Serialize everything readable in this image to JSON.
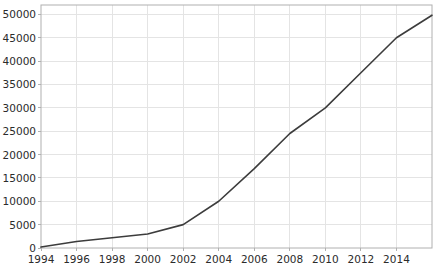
{
  "chart_data": {
    "type": "line",
    "title": "",
    "subtitle": "",
    "xlabel": "",
    "ylabel": "",
    "x": [
      1994,
      1996,
      1998,
      2000,
      2002,
      2004,
      2006,
      2008,
      2010,
      2012,
      2014,
      2016
    ],
    "values": [
      200,
      1400,
      2200,
      3000,
      5000,
      10000,
      17000,
      24500,
      30000,
      37500,
      45000,
      49800
    ],
    "series": [
      {
        "name": "series-1",
        "values": [
          200,
          1400,
          2200,
          3000,
          5000,
          10000,
          17000,
          24500,
          30000,
          37500,
          45000,
          49800
        ]
      }
    ],
    "xlim": [
      1994,
      2016
    ],
    "ylim": [
      0,
      52000
    ],
    "xticks": [
      1994,
      1996,
      1998,
      2000,
      2002,
      2004,
      2006,
      2008,
      2010,
      2012,
      2014
    ],
    "xtick_labels": [
      "1994",
      "1996",
      "1998",
      "2000",
      "2002",
      "2004",
      "2006",
      "2008",
      "2010",
      "2012",
      "2014"
    ],
    "yticks": [
      0,
      5000,
      10000,
      15000,
      20000,
      25000,
      30000,
      35000,
      40000,
      45000,
      50000
    ],
    "ytick_labels": [
      "0",
      "5000",
      "10000",
      "15000",
      "20000",
      "25000",
      "30000",
      "35000",
      "40000",
      "45000",
      "50000"
    ],
    "grid": true,
    "grid_color": "#e4e4e4",
    "legend": false,
    "legend_position": "none",
    "line_color": "#3c3c3c",
    "line_width": 1.6,
    "axis_color": "#b0b0b0",
    "tick_text_color": "#2b2b2b",
    "background_color": "#ffffff",
    "annotations": []
  },
  "geometry": {
    "plot_left": 41,
    "plot_right": 432,
    "plot_top": 5,
    "plot_bottom": 248
  }
}
